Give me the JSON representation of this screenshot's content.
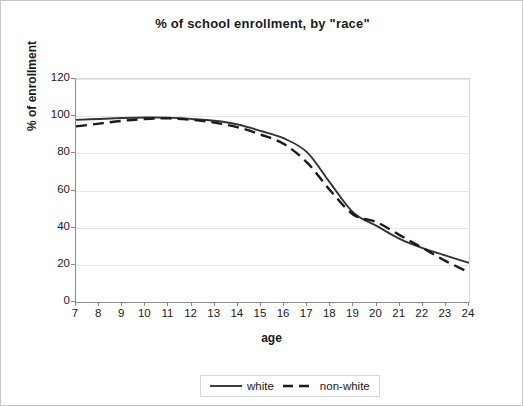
{
  "chart_data": {
    "type": "line",
    "title": "% of school enrollment, by \"race\"",
    "xlabel": "age",
    "ylabel": "% of enrollment",
    "xlim": [
      7,
      24
    ],
    "ylim": [
      0,
      120
    ],
    "ytick_step": 20,
    "grid": true,
    "legend_position": "bottom",
    "x": [
      7,
      8,
      9,
      10,
      11,
      12,
      13,
      14,
      15,
      16,
      17,
      18,
      19,
      20,
      21,
      22,
      23,
      24
    ],
    "xticks": [
      "7",
      "8",
      "9",
      "10",
      "11",
      "12",
      "13",
      "14",
      "15",
      "16",
      "17",
      "18",
      "19",
      "20",
      "21",
      "22",
      "23",
      "24"
    ],
    "yticks": [
      "0",
      "20",
      "40",
      "60",
      "80",
      "100",
      "120"
    ],
    "ytick_values": [
      0,
      20,
      40,
      60,
      80,
      100,
      120
    ],
    "series": [
      {
        "name": "white",
        "style": "solid",
        "color": "#333333",
        "values": [
          98,
          98.5,
          99,
          99.3,
          99.2,
          98.5,
          97.5,
          95.5,
          92,
          88,
          80.5,
          64,
          48,
          41,
          34,
          29,
          25,
          21
        ]
      },
      {
        "name": "non-white",
        "style": "dashed",
        "color": "#1a1a1a",
        "values": [
          94.5,
          96,
          97.5,
          98.5,
          98.8,
          98,
          96.5,
          94,
          90,
          85,
          75,
          60,
          47,
          43,
          36,
          29,
          22,
          16
        ]
      }
    ]
  },
  "legend": {
    "entries": [
      {
        "label": "white"
      },
      {
        "label": "non-white"
      }
    ]
  }
}
